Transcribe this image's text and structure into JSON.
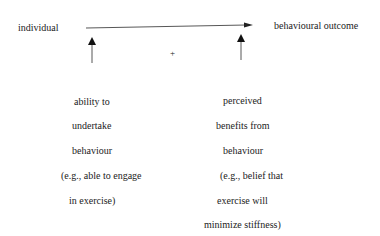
{
  "diagram": {
    "nodes": {
      "individual": "individual",
      "outcome": "behavioural outcome",
      "interaction_sign": "+"
    },
    "left_factor": {
      "lines": [
        "ability to",
        "undertake",
        "behaviour",
        "(e.g., able to engage",
        "in exercise)"
      ]
    },
    "right_factor": {
      "lines": [
        "perceived",
        "benefits from",
        "behaviour",
        "(e.g., belief that",
        "exercise will",
        "minimize stiffness)"
      ]
    },
    "edges": [
      {
        "from": "individual",
        "to": "behavioural outcome",
        "type": "arrow"
      },
      {
        "from": "ability to undertake behaviour",
        "to": "individual-outcome path",
        "type": "arrow"
      },
      {
        "from": "perceived benefits from behaviour",
        "to": "individual-outcome path",
        "type": "arrow"
      }
    ]
  }
}
